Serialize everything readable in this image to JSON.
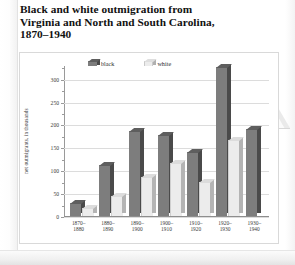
{
  "figure": {
    "title_lines": [
      "Black and white outmigration from",
      "Virginia and North and South Carolina,",
      "1870–1940"
    ]
  },
  "legend": {
    "position": "top-inside",
    "items": [
      {
        "label": "black",
        "color": "#7d7d7d",
        "icon": "cube-swatch-dark"
      },
      {
        "label": "white",
        "color": "#ececec",
        "icon": "cube-swatch-light"
      }
    ]
  },
  "axes": {
    "ylabel": "net outmigrants, in thousands",
    "yticks": [
      "0",
      "50",
      "100",
      "150",
      "200",
      "250",
      "300"
    ],
    "xticks": [
      "1870–\n1880",
      "1880–\n1890",
      "1890–\n1900",
      "1900–\n1910",
      "1910–\n1920",
      "1920–\n1930",
      "1930–\n1940"
    ]
  },
  "chart_data": {
    "type": "bar",
    "title": "Black and white outmigration from Virginia and North and South Carolina, 1870–1940",
    "xlabel": "",
    "ylabel": "net outmigrants, in thousands",
    "ylim": [
      0,
      330
    ],
    "yticks": [
      0,
      50,
      100,
      150,
      200,
      250,
      300
    ],
    "grid": true,
    "legend_position": "top-inside",
    "categories": [
      "1870–1880",
      "1880–1890",
      "1890–1900",
      "1900–1910",
      "1910–1920",
      "1920–1930",
      "1930–1940"
    ],
    "series": [
      {
        "name": "black",
        "color": "#7d7d7d",
        "values": [
          28,
          112,
          186,
          176,
          140,
          325,
          190
        ]
      },
      {
        "name": "white",
        "color": "#ececec",
        "values": [
          17,
          44,
          86,
          116,
          74,
          166,
          0
        ]
      }
    ]
  }
}
